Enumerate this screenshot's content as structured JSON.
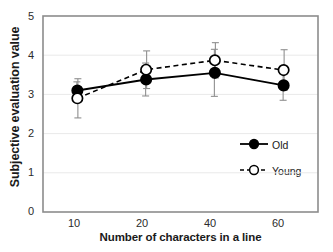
{
  "chart_data": {
    "type": "line",
    "title": "",
    "xlabel": "Number of characters in a line",
    "ylabel": "Subjective evaluation value",
    "categories": [
      "10",
      "20",
      "40",
      "60"
    ],
    "ylim": [
      0,
      5
    ],
    "yticks": [
      "0",
      "1",
      "2",
      "3",
      "4",
      "5"
    ],
    "grid": true,
    "legend_position": "inside-right-lower",
    "series": [
      {
        "name": "Old",
        "marker": "filled-circle",
        "linestyle": "solid",
        "color": "#000000",
        "values": [
          3.1,
          3.38,
          3.55,
          3.23
        ],
        "errors": [
          0.22,
          0.42,
          0.6,
          0.38
        ]
      },
      {
        "name": "Young",
        "marker": "open-circle",
        "linestyle": "dashed",
        "color": "#000000",
        "values": [
          2.9,
          3.63,
          3.87,
          3.62
        ],
        "errors": [
          0.5,
          0.48,
          0.45,
          0.52
        ]
      }
    ]
  },
  "axis": {
    "y_title": "Subjective evaluation value",
    "x_title": "Number of characters in a line",
    "y_tick_0": "0",
    "y_tick_1": "1",
    "y_tick_2": "2",
    "y_tick_3": "3",
    "y_tick_4": "4",
    "y_tick_5": "5",
    "x_tick_0": "10",
    "x_tick_1": "20",
    "x_tick_2": "40",
    "x_tick_3": "60"
  },
  "legend": {
    "old_label": "Old",
    "young_label": "Young"
  },
  "colors": {
    "line": "#000000",
    "grid": "#e8e8e8",
    "frame": "#808080",
    "text": "#1a1a1a"
  }
}
